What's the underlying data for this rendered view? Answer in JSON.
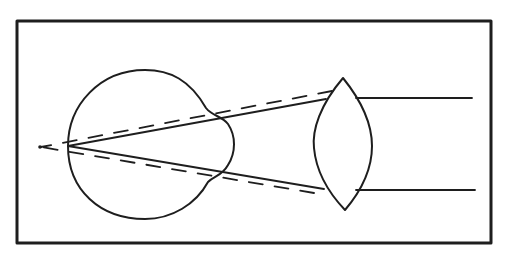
{
  "diagram": {
    "title": "",
    "colors": {
      "background": "#ffffff",
      "line": "#1e1e1e"
    },
    "frame": {
      "x": 17,
      "y": 21,
      "width": 474,
      "height": 222,
      "stroke_width": 3
    },
    "eye": {
      "label": "eyeball",
      "path": "M 206 108 C 190 80, 170 70, 145 70 C 100 70, 68 105, 68 146 C 68 190, 100 219, 145 219 C 172 219, 196 204, 208 182 C 214 176, 222 176, 228 165 C 236 152, 236 136, 228 124 C 222 116, 212 116, 206 108 Z"
    },
    "lens": {
      "label": "convex lens",
      "path": "M 343 78 C 320 105, 312 130, 314 148 C 316 170, 326 190, 345 210 C 362 190, 372 170, 372 146 C 372 125, 364 104, 343 78 Z"
    },
    "rays_solid": [
      {
        "label": "incoming ray top",
        "x1": 472,
        "y1": 98,
        "x2": 356,
        "y2": 98
      },
      {
        "label": "incoming ray bottom",
        "x1": 475,
        "y1": 190,
        "x2": 356,
        "y2": 190
      },
      {
        "label": "refracted ray top",
        "x1": 326,
        "y1": 99,
        "x2": 68,
        "y2": 146
      },
      {
        "label": "refracted ray bottom",
        "x1": 324,
        "y1": 189,
        "x2": 68,
        "y2": 146
      }
    ],
    "rays_dashed": [
      {
        "label": "uncorrected ray top",
        "x1": 332,
        "y1": 91,
        "x2": 41,
        "y2": 147
      },
      {
        "label": "uncorrected ray bottom",
        "x1": 314,
        "y1": 193,
        "x2": 41,
        "y2": 147
      }
    ],
    "focal_point": {
      "label": "uncorrected focal point",
      "cx": 40,
      "cy": 147,
      "r": 1.8
    },
    "retina_point": {
      "label": "corrected focus on retina",
      "x": 68,
      "y": 146
    }
  }
}
